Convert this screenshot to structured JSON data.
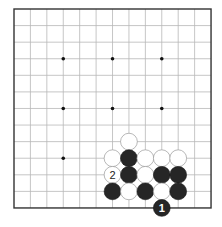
{
  "board": {
    "size": 13,
    "origin_px": {
      "x": 14,
      "y": 9
    },
    "spacing_px": {
      "x": 16.42,
      "y": 16.58
    },
    "stone_radius_px": 8.4,
    "colors": {
      "background": "#ffffff",
      "grid": "#b8b8b8",
      "frame": "#333333",
      "black_stone": "#262626",
      "white_stone": "#ffffff"
    },
    "hoshi": [
      {
        "col": 3,
        "row": 3
      },
      {
        "col": 6,
        "row": 3
      },
      {
        "col": 9,
        "row": 3
      },
      {
        "col": 3,
        "row": 6
      },
      {
        "col": 6,
        "row": 6
      },
      {
        "col": 9,
        "row": 6
      },
      {
        "col": 3,
        "row": 9
      }
    ],
    "stones": [
      {
        "color": "white",
        "col": 7,
        "row": 8
      },
      {
        "color": "white",
        "col": 6,
        "row": 9
      },
      {
        "color": "black",
        "col": 7,
        "row": 9
      },
      {
        "color": "white",
        "col": 8,
        "row": 9
      },
      {
        "color": "white",
        "col": 9,
        "row": 9
      },
      {
        "color": "white",
        "col": 10,
        "row": 9
      },
      {
        "color": "white",
        "col": 6,
        "row": 10,
        "label": "2"
      },
      {
        "color": "black",
        "col": 7,
        "row": 10
      },
      {
        "color": "white",
        "col": 8,
        "row": 10
      },
      {
        "color": "black",
        "col": 9,
        "row": 10
      },
      {
        "color": "black",
        "col": 10,
        "row": 10
      },
      {
        "color": "black",
        "col": 6,
        "row": 11
      },
      {
        "color": "white",
        "col": 7,
        "row": 11
      },
      {
        "color": "black",
        "col": 8,
        "row": 11
      },
      {
        "color": "white",
        "col": 9,
        "row": 11
      },
      {
        "color": "black",
        "col": 10,
        "row": 11
      },
      {
        "color": "black",
        "col": 9,
        "row": 12,
        "label": "1"
      }
    ]
  }
}
